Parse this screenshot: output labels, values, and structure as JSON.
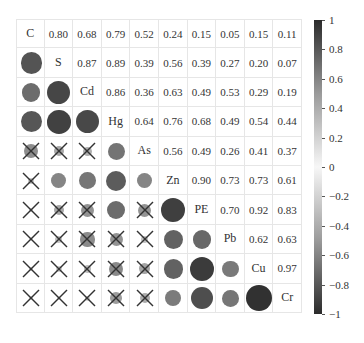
{
  "chart_data": {
    "type": "heatmap",
    "subtype": "correlation-matrix",
    "title": "",
    "variables": [
      "C",
      "S",
      "Cd",
      "Hg",
      "As",
      "Zn",
      "PE",
      "Pb",
      "Cu",
      "Cr"
    ],
    "upper_triangle": "numeric coefficients",
    "lower_triangle": "circles (size and shade proportional to |r|); X marks non-significant",
    "matrix": [
      [
        1.0,
        0.8,
        0.68,
        0.79,
        0.52,
        0.24,
        0.15,
        0.05,
        0.15,
        0.11
      ],
      [
        0.8,
        1.0,
        0.87,
        0.89,
        0.39,
        0.56,
        0.39,
        0.27,
        0.2,
        0.07
      ],
      [
        0.68,
        0.87,
        1.0,
        0.86,
        0.36,
        0.63,
        0.49,
        0.53,
        0.29,
        0.19
      ],
      [
        0.79,
        0.89,
        0.86,
        1.0,
        0.64,
        0.76,
        0.68,
        0.49,
        0.54,
        0.44
      ],
      [
        0.52,
        0.39,
        0.36,
        0.64,
        1.0,
        0.56,
        0.49,
        0.26,
        0.41,
        0.37
      ],
      [
        0.24,
        0.56,
        0.63,
        0.76,
        0.56,
        1.0,
        0.9,
        0.73,
        0.73,
        0.61
      ],
      [
        0.15,
        0.39,
        0.49,
        0.68,
        0.49,
        0.9,
        1.0,
        0.7,
        0.92,
        0.83
      ],
      [
        0.05,
        0.27,
        0.53,
        0.49,
        0.26,
        0.73,
        0.7,
        1.0,
        0.62,
        0.63
      ],
      [
        0.15,
        0.2,
        0.29,
        0.54,
        0.41,
        0.73,
        0.92,
        0.62,
        1.0,
        0.97
      ],
      [
        0.11,
        0.07,
        0.19,
        0.44,
        0.37,
        0.61,
        0.83,
        0.63,
        0.97,
        1.0
      ]
    ],
    "upper_labels": [
      [
        "C",
        "0.80",
        "0.68",
        "0.79",
        "0.52",
        "0.24",
        "0.15",
        "0.05",
        "0.15",
        "0.11"
      ],
      [
        "",
        "S",
        "0.87",
        "0.89",
        "0.39",
        "0.56",
        "0.39",
        "0.27",
        "0.20",
        "0.07"
      ],
      [
        "",
        "",
        "Cd",
        "0.86",
        "0.36",
        "0.63",
        "0.49",
        "0.53",
        "0.29",
        "0.19"
      ],
      [
        "",
        "",
        "",
        "Hg",
        "0.64",
        "0.76",
        "0.68",
        "0.49",
        "0.54",
        "0.44"
      ],
      [
        "",
        "",
        "",
        "",
        "As",
        "0.56",
        "0.49",
        "0.26",
        "0.41",
        "0.37"
      ],
      [
        "",
        "",
        "",
        "",
        "",
        "Zn",
        "0.90",
        "0.73",
        "0.73",
        "0.61"
      ],
      [
        "",
        "",
        "",
        "",
        "",
        "",
        "PE",
        "0.70",
        "0.92",
        "0.83"
      ],
      [
        "",
        "",
        "",
        "",
        "",
        "",
        "",
        "Pb",
        "0.62",
        "0.63"
      ],
      [
        "",
        "",
        "",
        "",
        "",
        "",
        "",
        "",
        "Cu",
        "0.97"
      ],
      [
        "",
        "",
        "",
        "",
        "",
        "",
        "",
        "",
        "",
        "Cr"
      ]
    ],
    "non_significant": [
      [
        4,
        0
      ],
      [
        4,
        1
      ],
      [
        4,
        2
      ],
      [
        5,
        0
      ],
      [
        6,
        0
      ],
      [
        6,
        1
      ],
      [
        6,
        2
      ],
      [
        6,
        4
      ],
      [
        7,
        0
      ],
      [
        7,
        1
      ],
      [
        7,
        2
      ],
      [
        7,
        3
      ],
      [
        7,
        4
      ],
      [
        8,
        0
      ],
      [
        8,
        1
      ],
      [
        8,
        2
      ],
      [
        8,
        3
      ],
      [
        8,
        4
      ],
      [
        9,
        0
      ],
      [
        9,
        1
      ],
      [
        9,
        2
      ],
      [
        9,
        3
      ],
      [
        9,
        4
      ]
    ],
    "colorbar": {
      "range": [
        -1,
        1
      ],
      "ticks": [
        "1",
        "0.8",
        "0.6",
        "0.4",
        "0.2",
        "0",
        "−0.2",
        "−0.4",
        "−0.6",
        "−0.8",
        "−1"
      ],
      "tick_values": [
        1,
        0.8,
        0.6,
        0.4,
        0.2,
        0,
        -0.2,
        -0.4,
        -0.6,
        -0.8,
        -1
      ],
      "colors": {
        "high": "#2b2b2b",
        "mid": "#f7f7f7",
        "low": "#2b2b2b"
      },
      "position": "right"
    },
    "grid": true
  },
  "colors": {
    "grid_line": "#e6e6e6",
    "cross": "#333333",
    "text": "#333333"
  }
}
